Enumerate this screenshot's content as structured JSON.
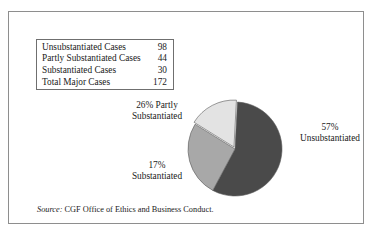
{
  "figure": {
    "source_note_label": "Source:",
    "source_note_text": " CGF Office of Ethics and Business Conduct."
  },
  "legend": {
    "rows": [
      {
        "label": "Unsubstantiated Cases",
        "value": "98"
      },
      {
        "label": "Partly Substantiated Cases",
        "value": "44"
      },
      {
        "label": "Substantiated Cases",
        "value": "30"
      }
    ],
    "total": {
      "label": "Total Major Cases",
      "value": "172"
    }
  },
  "callouts": {
    "partly": {
      "line1": "26% Partly",
      "line2": "Substantiated"
    },
    "substantiated": {
      "line1": "17%",
      "line2": "Substantiated"
    },
    "unsubstantiated": {
      "line1": "57%",
      "line2": "Unsubstantiated"
    }
  },
  "colors": {
    "unsubstantiated": "#4a4a4a",
    "partly": "#a8a8a8",
    "substantiated": "#e3e3e3",
    "slice_outline": "#5a5a5a",
    "frame": "#8e8e8e",
    "table_border": "#6f6f6f",
    "background": "#ffffff"
  },
  "chart_data": {
    "type": "pie",
    "title": "",
    "subtitle": "",
    "xlabel": "",
    "ylabel": "",
    "legend_position": "top-left-table",
    "grid": false,
    "total": 172,
    "total_label": "Total Major Cases",
    "categories": [
      "Unsubstantiated",
      "Partly Substantiated",
      "Substantiated"
    ],
    "values": [
      98,
      44,
      30
    ],
    "percents": [
      57,
      26,
      17
    ],
    "slices": [
      {
        "name": "Unsubstantiated",
        "value": 98,
        "percent": 57,
        "color": "#4a4a4a",
        "label": "57% Unsubstantiated"
      },
      {
        "name": "Partly Substantiated",
        "value": 44,
        "percent": 26,
        "color": "#a8a8a8",
        "label": "26% Partly Substantiated"
      },
      {
        "name": "Substantiated",
        "value": 30,
        "percent": 17,
        "color": "#e3e3e3",
        "label": "17% Substantiated"
      }
    ],
    "annotations": [
      "Source: CGF Office of Ethics and Business Conduct."
    ]
  }
}
